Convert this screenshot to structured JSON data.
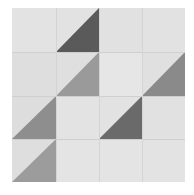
{
  "image": {
    "subject": "Quilt block of half-square triangles in grayscale",
    "background_color": "#e0e0e0",
    "grid": {
      "rows": 4,
      "cols": 4
    },
    "cells": [
      {
        "row": 0,
        "col": 0,
        "fill": "#e3e3e3",
        "triangle": null
      },
      {
        "row": 0,
        "col": 1,
        "fill": "#e2e2e2",
        "triangle": {
          "corner": "bottom-right",
          "color": "#5a5a5a"
        }
      },
      {
        "row": 0,
        "col": 2,
        "fill": "#e1e1e1",
        "triangle": null
      },
      {
        "row": 0,
        "col": 3,
        "fill": "#e2e2e2",
        "triangle": null
      },
      {
        "row": 1,
        "col": 0,
        "fill": "#dedede",
        "triangle": null
      },
      {
        "row": 1,
        "col": 1,
        "fill": "#dfdfdf",
        "triangle": {
          "corner": "bottom-right",
          "color": "#9a9a9a"
        }
      },
      {
        "row": 1,
        "col": 2,
        "fill": "#e6e6e6",
        "triangle": null
      },
      {
        "row": 1,
        "col": 3,
        "fill": "#e0e0e0",
        "triangle": {
          "corner": "bottom-right",
          "color": "#8a8a8a"
        }
      },
      {
        "row": 2,
        "col": 0,
        "fill": "#dddddd",
        "triangle": {
          "corner": "bottom-right",
          "color": "#8e8e8e"
        }
      },
      {
        "row": 2,
        "col": 1,
        "fill": "#e3e3e3",
        "triangle": null
      },
      {
        "row": 2,
        "col": 2,
        "fill": "#e2e2e2",
        "triangle": {
          "corner": "bottom-right",
          "color": "#6a6a6a"
        }
      },
      {
        "row": 2,
        "col": 3,
        "fill": "#e1e1e1",
        "triangle": null
      },
      {
        "row": 3,
        "col": 0,
        "fill": "#dedede",
        "triangle": {
          "corner": "bottom-right",
          "color": "#9c9c9c"
        }
      },
      {
        "row": 3,
        "col": 1,
        "fill": "#e4e4e4",
        "triangle": null
      },
      {
        "row": 3,
        "col": 2,
        "fill": "#e4e4e4",
        "triangle": null
      },
      {
        "row": 3,
        "col": 3,
        "fill": "#e3e3e3",
        "triangle": null
      }
    ]
  }
}
